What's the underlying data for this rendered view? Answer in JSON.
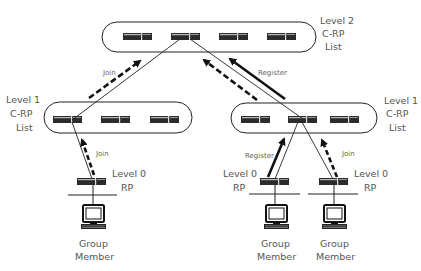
{
  "diagram": {
    "levels": {
      "level2": {
        "line1": "Level 2",
        "line2": "C-RP",
        "line3": "List",
        "router_count": 4
      },
      "level1_left": {
        "line1": "Level 1",
        "line2": "C-RP",
        "line3": "List",
        "router_count": 3
      },
      "level1_right": {
        "line1": "Level 1",
        "line2": "C-RP",
        "line3": "List",
        "router_count": 3
      },
      "level0_left": {
        "line1": "Level 0",
        "line2": "RP"
      },
      "level0_mid": {
        "line1": "Level 0",
        "line2": "RP"
      },
      "level0_right": {
        "line1": "Level 0",
        "line2": "RP"
      }
    },
    "members": [
      {
        "line1": "Group",
        "line2": "Member"
      },
      {
        "line1": "Group",
        "line2": "Member"
      },
      {
        "line1": "Group",
        "line2": "Member"
      }
    ],
    "arrows": {
      "join_l1_left_to_l2": "Join",
      "join_l2_to_l1_right": "Join",
      "register_l1_right_to_l2": "Register",
      "join_l0_left_to_l1": "Join",
      "register_l0_mid_to_l1": "Register",
      "join_l0_right_to_l1": "Join"
    },
    "legend": {
      "join_style": "dashed",
      "register_style": "solid"
    },
    "colors": {
      "router": "#2b2b2b",
      "line": "#222222",
      "text": "#555555"
    }
  }
}
